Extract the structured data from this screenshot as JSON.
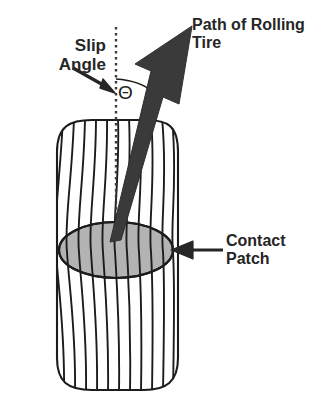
{
  "diagram": {
    "background_color": "#ffffff",
    "ink_color": "#1c1c1c",
    "text_color": "#262626",
    "labels": {
      "slip_angle": "Slip\nAngle",
      "path_of_rolling_tire": "Path of Rolling\nTire",
      "contact_patch": "Contact\nPatch",
      "angle_symbol": "Θ"
    },
    "elements": {
      "tire_body": {
        "name": "tire-body",
        "description": "rounded rectangle tire tread viewed from above",
        "stroke_color": "#1c1c1c",
        "fill_color": "#ffffff",
        "left": 57,
        "right": 178,
        "top": 120,
        "bottom": 390
      },
      "contact_patch_ellipse": {
        "name": "contact-patch-ellipse",
        "fill_color": "#b3b3b3",
        "stroke_color": "#1c1c1c",
        "center_x": 116,
        "center_y": 250,
        "radius_x": 57,
        "radius_y": 28
      },
      "tread_lines": {
        "name": "tread-lines",
        "count": 12,
        "stroke_color": "#1c1c1c"
      },
      "centerline": {
        "name": "vertical-centerline",
        "style": "dotted",
        "color": "#3a3a3a",
        "x": 116,
        "y_top": 27,
        "y_bottom": 243
      },
      "path_arrow": {
        "name": "path-of-rolling-tire-arrow",
        "style": "thick solid arrow",
        "color": "#3a3a3a",
        "tail_x": 114,
        "tail_y": 240,
        "tip_x": 192,
        "tip_y": 26
      },
      "angle_arc": {
        "name": "slip-angle-arc",
        "color": "#1c1c1c",
        "from_x": 116,
        "from_y": 79,
        "to_x": 152,
        "to_y": 90
      },
      "slip_angle_pointer": {
        "name": "slip-angle-pointer-arrow",
        "color": "#262626",
        "tail_x": 76,
        "tail_y": 70,
        "tip_x": 114,
        "tip_y": 92
      },
      "contact_patch_pointer": {
        "name": "contact-patch-pointer-arrow",
        "color": "#262626",
        "tail_x": 223,
        "tail_y": 250,
        "tip_x": 172,
        "tip_y": 250
      }
    }
  }
}
